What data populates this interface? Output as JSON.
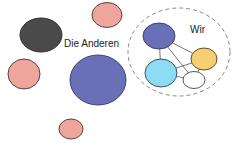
{
  "labels": {
    "others": "Die Anderen",
    "us": "Wir"
  },
  "colors": {
    "pink": "#eea59c",
    "dark_grey": "#4a4a4a",
    "indigo": "#6a70b8",
    "light_blue": "#8ddcf4",
    "yellow": "#f6cf72",
    "white": "#ffffff",
    "outline": "#4d3b3b",
    "dashed": "#888888"
  },
  "groups": {
    "others": {
      "name": "Die Anderen",
      "member_count": 5
    },
    "us": {
      "name": "Wir",
      "member_count": 4
    }
  }
}
